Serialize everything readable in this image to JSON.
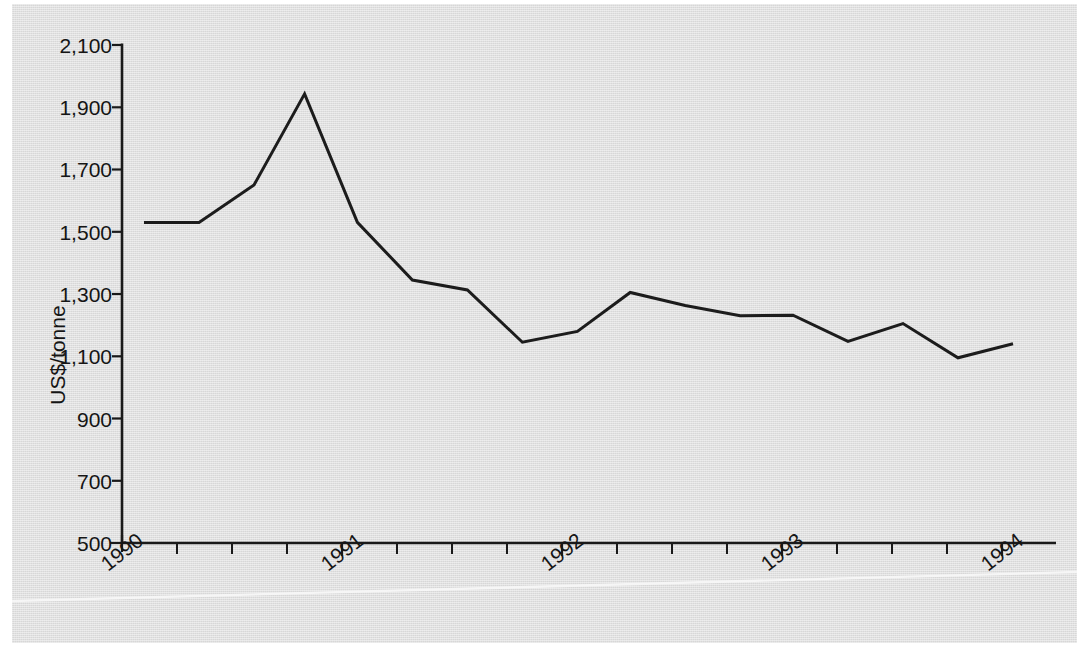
{
  "chart_data": {
    "type": "line",
    "title": "",
    "subtitle": "",
    "xlabel": "",
    "ylabel": "US$/tonne",
    "ylim": [
      500,
      2100
    ],
    "ytick_labels": [
      "2,100",
      "1,900",
      "1,700",
      "1,500",
      "1,300",
      "1,100",
      "900",
      "700",
      "500"
    ],
    "ytick_values": [
      2100,
      1900,
      1700,
      1500,
      1300,
      1100,
      900,
      700,
      500
    ],
    "xtick_labels": [
      "1990",
      "1991",
      "1992",
      "1993",
      "1994"
    ],
    "xtick_values": [
      1990,
      1991,
      1992,
      1993,
      1994
    ],
    "x_minor_ticks_per_year": 4,
    "grid": false,
    "legend": false,
    "series": [
      {
        "name": "Price",
        "x": [
          1990.1,
          1990.35,
          1990.6,
          1990.83,
          1991.07,
          1991.32,
          1991.57,
          1991.82,
          1992.07,
          1992.31,
          1992.56,
          1992.81,
          1993.05,
          1993.3,
          1993.55,
          1993.8,
          1994.05
        ],
        "values": [
          1530,
          1530,
          1650,
          1943,
          1530,
          1345,
          1313,
          1145,
          1180,
          1305,
          1263,
          1230,
          1232,
          1148,
          1205,
          1095,
          1140
        ]
      }
    ]
  },
  "axes": {
    "y_axis_title": "US$/tonne",
    "y_ticks": [
      "2,100",
      "1,900",
      "1,700",
      "1,500",
      "1,300",
      "1,100",
      "900",
      "700",
      "500"
    ],
    "x_ticks": [
      "1990",
      "1991",
      "1992",
      "1993",
      "1994"
    ]
  }
}
